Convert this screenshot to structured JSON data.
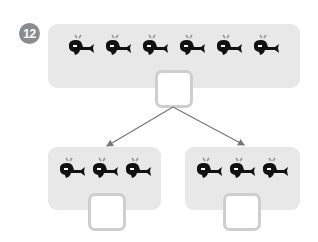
{
  "problem": {
    "number": "12",
    "badge_color": "#8c8c8c"
  },
  "top_group": {
    "whale_count": 6,
    "answer_value": ""
  },
  "bottom_groups": [
    {
      "whale_count": 3,
      "answer_value": ""
    },
    {
      "whale_count": 3,
      "answer_value": ""
    }
  ],
  "colors": {
    "panel": "#e8e8e8",
    "box_border": "#cecece",
    "arrow": "#777777",
    "whale": "#111111",
    "spout": "#999999"
  }
}
